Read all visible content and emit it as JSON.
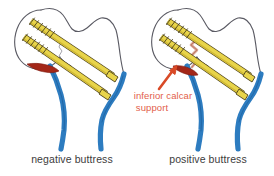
{
  "figure": {
    "background_color": "#ffffff",
    "width": 274,
    "height": 176
  },
  "palette": {
    "screw_fill": "#e8d44a",
    "screw_shade": "#c9b02f",
    "screw_outline": "#4a3f18",
    "bone_outline": "#5a5a63",
    "bone_fill": "#ffffff",
    "vessel_blue": "#2d7cc0",
    "vessel_blue_dark": "#1d5f9c",
    "calcar_red": "#a32718",
    "fracture_pink": "#d9a08f",
    "arrow_red": "#d94a27",
    "annotation_text": "#e2604a",
    "caption_text": "#3c3c3c"
  },
  "panels": [
    {
      "id": "left",
      "caption": "negative buttress",
      "caption_x": 72,
      "caption_y": 163,
      "has_arrow": false,
      "has_annotation": false,
      "calcar_color": "#a32718",
      "screw_count": 2
    },
    {
      "id": "right",
      "caption": "positive buttress",
      "caption_x": 208,
      "caption_y": 163,
      "has_arrow": true,
      "has_annotation": true,
      "calcar_color": "#a32718",
      "screw_count": 2
    }
  ],
  "annotation": {
    "line1": "inferior calcar",
    "line2": "support",
    "line1_x": 163,
    "line1_y": 99,
    "line2_x": 152,
    "line2_y": 111,
    "color": "#e2604a"
  },
  "arrow": {
    "name": "inferior-calcar-support-arrow",
    "color": "#d94a27",
    "from_x": 159,
    "from_y": 89,
    "to_x": 176,
    "to_y": 67
  },
  "anatomy_labels": {
    "femoral_head": "femoral-head",
    "femoral_neck": "femoral-neck",
    "greater_trochanter": "greater-trochanter",
    "femoral_shaft": "femoral-shaft",
    "calcar_femorale": "calcar-femorale",
    "cannulated_screw": "cannulated-screw",
    "fracture_line": "fracture-line"
  }
}
